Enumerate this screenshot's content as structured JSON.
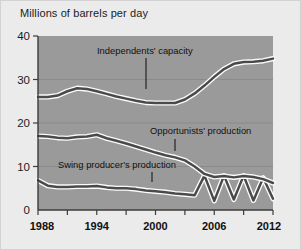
{
  "chart_data": {
    "type": "line",
    "title": "Millions of barrels per day",
    "xlabel": "",
    "ylabel": "Millions of barrels per day",
    "xlim": [
      1988,
      2012
    ],
    "ylim": [
      0,
      40
    ],
    "yticks": [
      0,
      10,
      20,
      30,
      40
    ],
    "xticks": [
      1988,
      1991,
      1994,
      1997,
      2000,
      2003,
      2006,
      2009,
      2012
    ],
    "xtick_labels": [
      "1988",
      "1994",
      "2000",
      "2006",
      "2012"
    ],
    "xtick_label_values": [
      1988,
      1994,
      2000,
      2006,
      2012
    ],
    "grid": "horizontal gridlines at 10, 20, 30",
    "legend": "inline annotations with leader lines",
    "series": [
      {
        "name": "Independents' capacity",
        "x": [
          1988,
          1989,
          1990,
          1991,
          1992,
          1993,
          1994,
          1995,
          1996,
          1997,
          1998,
          1999,
          2000,
          2001,
          2002,
          2003,
          2004,
          2005,
          2006,
          2007,
          2008,
          2009,
          2010,
          2011,
          2012
        ],
        "values": [
          26.0,
          26.0,
          26.3,
          27.3,
          28.0,
          27.8,
          27.3,
          26.7,
          26.1,
          25.6,
          25.1,
          24.7,
          24.6,
          24.6,
          24.6,
          25.4,
          26.8,
          28.6,
          30.6,
          32.4,
          33.6,
          34.0,
          34.1,
          34.3,
          34.8
        ]
      },
      {
        "name": "Opportunists' production",
        "x": [
          1988,
          1989,
          1990,
          1991,
          1992,
          1993,
          1994,
          1995,
          1996,
          1997,
          1998,
          1999,
          2000,
          2001,
          2002,
          2003,
          2004,
          2005,
          2006,
          2007,
          2008,
          2009,
          2010,
          2011,
          2012
        ],
        "values": [
          17.0,
          16.9,
          16.6,
          16.5,
          16.8,
          16.9,
          17.3,
          16.5,
          15.9,
          15.3,
          14.6,
          13.9,
          13.2,
          12.6,
          12.1,
          11.4,
          10.0,
          8.3,
          7.6,
          7.8,
          7.5,
          7.8,
          7.6,
          7.1,
          6.2
        ]
      },
      {
        "name": "Swing producer's production",
        "x": [
          1988,
          1989,
          1990,
          1991,
          1992,
          1993,
          1994,
          1995,
          1996,
          1997,
          1998,
          1999,
          2000,
          2001,
          2002,
          2003,
          2004,
          2005,
          2006,
          2007,
          2008,
          2009,
          2010,
          2011,
          2012
        ],
        "values": [
          6.8,
          5.6,
          5.3,
          5.3,
          5.4,
          5.4,
          5.5,
          5.2,
          5.0,
          5.0,
          4.8,
          4.5,
          4.3,
          4.1,
          3.8,
          3.6,
          3.4,
          7.9,
          2.1,
          7.9,
          2.4,
          7.9,
          2.2,
          7.4,
          2.6
        ]
      }
    ],
    "annotations": [
      {
        "label": "Independents' capacity",
        "points_to_series": "Independents' capacity",
        "at_x": 1999
      },
      {
        "label": "Opportunists' production",
        "points_to_series": "Opportunists' production",
        "at_x": 2003
      },
      {
        "label": "Swing producer's production",
        "points_to_series": "Swing producer's production",
        "at_x": 2000
      }
    ],
    "colors": {
      "page_background": "#ebebeb",
      "plot_background": "#9a9a9a",
      "line": "#4a4a4a",
      "line_halo": "#fbfbfb",
      "gridline": "#8a8a8a",
      "axis": "#3c3c3c",
      "text": "#111111"
    }
  },
  "axis": {
    "y_tick_labels": [
      "40",
      "30",
      "20",
      "10",
      "0"
    ],
    "x_tick_labels": [
      "1988",
      "1994",
      "2000",
      "2006",
      "2012"
    ]
  },
  "annotations": {
    "independents": "Independents' capacity",
    "opportunists": "Opportunists' production",
    "swing": "Swing producer's production"
  }
}
